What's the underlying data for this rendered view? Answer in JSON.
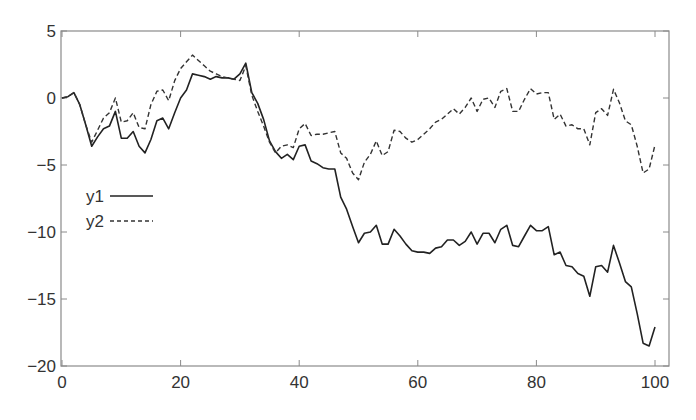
{
  "chart_data": {
    "type": "line",
    "title": "",
    "title_note": "title clipped at top edge, illegible",
    "xlabel": "",
    "ylabel": "",
    "xlim": [
      0,
      102.4
    ],
    "ylim": [
      -20,
      5
    ],
    "grid": false,
    "x_ticks": [
      0,
      20,
      40,
      60,
      80,
      100
    ],
    "x_tick_labels": [
      "0",
      "20",
      "40",
      "60",
      "80",
      "100"
    ],
    "y_ticks": [
      5,
      0,
      -5,
      -10,
      -15,
      -20
    ],
    "y_tick_labels": [
      "5",
      "0",
      "−5",
      "−10",
      "−15",
      "−20"
    ],
    "legend": {
      "position": "left-center inside plot",
      "entries": [
        {
          "label": "y1",
          "style": "solid"
        },
        {
          "label": "y2",
          "style": "dashed"
        }
      ]
    },
    "x": [
      0,
      1,
      2,
      3,
      4,
      5,
      6,
      7,
      8,
      9,
      10,
      11,
      12,
      13,
      14,
      15,
      16,
      17,
      18,
      19,
      20,
      21,
      22,
      23,
      24,
      25,
      26,
      27,
      28,
      29,
      30,
      31,
      32,
      33,
      34,
      35,
      36,
      37,
      38,
      39,
      40,
      41,
      42,
      43,
      44,
      45,
      46,
      47,
      48,
      49,
      50,
      51,
      52,
      53,
      54,
      55,
      56,
      57,
      58,
      59,
      60,
      61,
      62,
      63,
      64,
      65,
      66,
      67,
      68,
      69,
      70,
      71,
      72,
      73,
      74,
      75,
      76,
      77,
      78,
      79,
      80,
      81,
      82,
      83,
      84,
      85,
      86,
      87,
      88,
      89,
      90,
      91,
      92,
      93,
      94,
      95,
      96,
      97,
      98,
      99,
      100
    ],
    "series": [
      {
        "name": "y1",
        "style": "solid",
        "color": "#222222",
        "values": [
          0,
          0.1,
          0.4,
          -0.5,
          -2.0,
          -3.6,
          -2.9,
          -2.3,
          -2.1,
          -1.0,
          -3.0,
          -3.0,
          -2.5,
          -3.6,
          -4.1,
          -3.1,
          -1.7,
          -1.5,
          -2.3,
          -1.1,
          0.0,
          0.6,
          1.8,
          1.7,
          1.6,
          1.4,
          1.6,
          1.5,
          1.5,
          1.4,
          1.8,
          2.6,
          0.4,
          -0.4,
          -1.6,
          -3.2,
          -4.0,
          -4.5,
          -4.2,
          -4.6,
          -3.6,
          -3.5,
          -4.7,
          -4.9,
          -5.2,
          -5.3,
          -5.3,
          -7.4,
          -8.3,
          -9.6,
          -10.8,
          -10.1,
          -10.0,
          -9.5,
          -10.9,
          -10.9,
          -9.8,
          -10.3,
          -10.9,
          -11.4,
          -11.5,
          -11.5,
          -11.6,
          -11.2,
          -11.1,
          -10.6,
          -10.6,
          -11.0,
          -10.7,
          -10.0,
          -10.9,
          -10.1,
          -10.1,
          -10.8,
          -9.8,
          -9.5,
          -11.0,
          -11.1,
          -10.3,
          -9.5,
          -9.9,
          -9.9,
          -9.6,
          -11.7,
          -11.5,
          -12.5,
          -12.6,
          -13.1,
          -13.3,
          -14.8,
          -12.6,
          -12.5,
          -13.0,
          -11.0,
          -12.3,
          -13.7,
          -14.1,
          -16.1,
          -18.3,
          -18.5,
          -17.1
        ]
      },
      {
        "name": "y2",
        "style": "dashed",
        "color": "#333333",
        "values": [
          0,
          0.1,
          0.4,
          -0.5,
          -2.0,
          -3.3,
          -2.4,
          -1.5,
          -1.1,
          0.0,
          -1.8,
          -1.7,
          -1.1,
          -2.2,
          -2.3,
          -0.5,
          0.5,
          0.6,
          -0.2,
          1.3,
          2.2,
          2.7,
          3.2,
          2.8,
          2.4,
          2.0,
          1.8,
          1.6,
          1.5,
          1.4,
          1.3,
          2.4,
          0.2,
          -1.0,
          -2.1,
          -3.3,
          -4.1,
          -3.6,
          -3.5,
          -3.7,
          -2.3,
          -1.9,
          -2.8,
          -2.7,
          -2.7,
          -2.6,
          -2.5,
          -4.1,
          -4.5,
          -5.6,
          -6.1,
          -4.8,
          -4.2,
          -3.2,
          -4.3,
          -4.0,
          -2.4,
          -2.5,
          -3.0,
          -3.3,
          -3.1,
          -2.7,
          -2.3,
          -1.8,
          -1.6,
          -1.2,
          -0.8,
          -1.2,
          -0.7,
          0.0,
          -1.0,
          -0.1,
          0.0,
          -0.7,
          0.5,
          0.7,
          -1.0,
          -1.0,
          -0.1,
          0.7,
          0.3,
          0.4,
          0.4,
          -1.6,
          -1.2,
          -2.1,
          -2.0,
          -2.3,
          -2.3,
          -3.5,
          -1.1,
          -0.8,
          -1.3,
          0.65,
          -0.35,
          -1.7,
          -2.0,
          -3.6,
          -5.6,
          -5.3,
          -3.5
        ]
      }
    ]
  },
  "style": {
    "axis_color": "#8a8a8a",
    "text_color": "#333333",
    "background": "#ffffff"
  }
}
